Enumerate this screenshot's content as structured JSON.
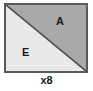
{
  "diagram": {
    "type": "half-square-triangle-block",
    "title": "",
    "block": {
      "shape": "square",
      "border_color": "#5a5a5a",
      "divider": "diagonal-top-left-to-bottom-right",
      "divider_color": "#4a4a4a"
    },
    "pieces": [
      {
        "label": "A",
        "position": "upper-right",
        "shape": "triangle",
        "fill_color": "#a9a9a9"
      },
      {
        "label": "E",
        "position": "lower-left",
        "shape": "triangle",
        "fill_color": "#e9e9e9"
      }
    ],
    "quantity_label": "x8",
    "background_color": "#ffffff"
  }
}
